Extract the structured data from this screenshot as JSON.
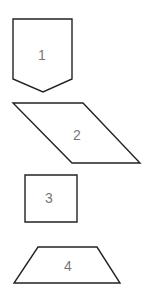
{
  "diagram": {
    "background": "#ffffff",
    "stroke_color": "#222222",
    "label_color": "#777777",
    "shapes": [
      {
        "id": 1,
        "type": "pentagon-shield",
        "label": "1"
      },
      {
        "id": 2,
        "type": "parallelogram",
        "label": "2"
      },
      {
        "id": 3,
        "type": "square",
        "label": "3"
      },
      {
        "id": 4,
        "type": "trapezoid",
        "label": "4"
      }
    ]
  }
}
